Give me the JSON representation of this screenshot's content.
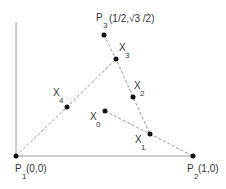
{
  "diagram": {
    "colors": {
      "axis": "#9a9a9a",
      "dashed": "#9a9a9a",
      "point": "#111111",
      "text": "#333333"
    },
    "points": {
      "P1": {
        "x": 16,
        "y": 156,
        "name": "P",
        "sub": "1",
        "coord": "(0,0)"
      },
      "P2": {
        "x": 193,
        "y": 156,
        "name": "P",
        "sub": "2",
        "coord": "(1,0)"
      },
      "P3": {
        "x": 104,
        "y": 35,
        "name": "P",
        "sub": "3",
        "coord": "(1/2,√3 /2)"
      },
      "X0": {
        "x": 105,
        "y": 111,
        "name": "X",
        "sub": "0"
      },
      "X1": {
        "x": 150,
        "y": 134,
        "name": "X",
        "sub": "1"
      },
      "X2": {
        "x": 133,
        "y": 97,
        "name": "X",
        "sub": "2"
      },
      "X3": {
        "x": 116,
        "y": 59,
        "name": "X",
        "sub": "3"
      },
      "X4": {
        "x": 67,
        "y": 107,
        "name": "X",
        "sub": "4"
      }
    },
    "dashed_paths": [
      [
        "X0",
        "X1",
        "P2"
      ],
      [
        "P3",
        "X3",
        "X2",
        "X1"
      ],
      [
        "P1",
        "X4",
        "X3"
      ]
    ]
  }
}
